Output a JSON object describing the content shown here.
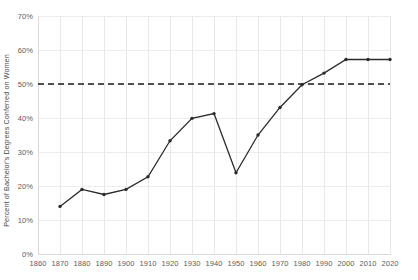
{
  "chart_data": {
    "type": "line",
    "title": "",
    "xlabel": "",
    "ylabel": "Percent of Bachelor's Degrees Conferred on Women",
    "x": [
      1870,
      1880,
      1890,
      1900,
      1910,
      1920,
      1930,
      1940,
      1950,
      1960,
      1970,
      1980,
      1990,
      2000,
      2010,
      2020
    ],
    "values": [
      14.0,
      19.0,
      17.5,
      19.0,
      22.7,
      33.3,
      39.9,
      41.3,
      23.9,
      35.0,
      43.1,
      49.8,
      53.2,
      57.2,
      57.2,
      57.2
    ],
    "series": [
      {
        "name": "Percent of Bachelor's Degrees Conferred on Women",
        "color": "#2b2b2b",
        "values": [
          14.0,
          19.0,
          17.5,
          19.0,
          22.7,
          33.3,
          39.9,
          41.3,
          23.9,
          35.0,
          43.1,
          49.8,
          53.2,
          57.2,
          57.2,
          57.2
        ]
      }
    ],
    "reference_line": {
      "label": "50%",
      "value": 50,
      "style": "dashed",
      "color": "#1a1a1a"
    },
    "xlim": [
      1860,
      2020
    ],
    "ylim": [
      0,
      70
    ],
    "xticks": [
      1860,
      1870,
      1880,
      1890,
      1900,
      1910,
      1920,
      1930,
      1940,
      1950,
      1960,
      1970,
      1980,
      1990,
      2000,
      2010,
      2020
    ],
    "xticklabels": [
      "1860",
      "1870",
      "1880",
      "1890",
      "1900",
      "1910",
      "1920",
      "1930",
      "1940",
      "1950",
      "1960",
      "1970",
      "1980",
      "1990",
      "2000",
      "2010",
      "2020"
    ],
    "yticks": [
      0,
      10,
      20,
      30,
      40,
      50,
      60,
      70
    ],
    "yticklabels": [
      "0%",
      "10%",
      "20%",
      "30%",
      "40%",
      "50%",
      "60%",
      "70%"
    ],
    "grid": true,
    "legend": "none",
    "marker": "dot"
  }
}
